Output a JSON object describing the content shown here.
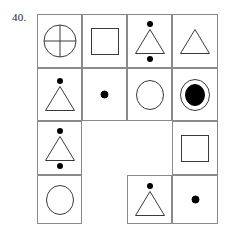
{
  "question": {
    "number": "40."
  },
  "colors": {
    "grid_line": "#8a8a8a",
    "shape_stroke": "#3a3a3a",
    "fill": "#000000",
    "background": "#ffffff"
  },
  "matrix": {
    "rows": 4,
    "columns": 4,
    "cells": [
      {
        "row": 0,
        "col": 0,
        "present": true,
        "figure": "circle-with-cross",
        "dot_above": false,
        "dot_below": false
      },
      {
        "row": 0,
        "col": 1,
        "present": true,
        "figure": "square",
        "dot_above": false,
        "dot_below": false
      },
      {
        "row": 0,
        "col": 2,
        "present": true,
        "figure": "triangle",
        "dot_above": true,
        "dot_below": true
      },
      {
        "row": 0,
        "col": 3,
        "present": true,
        "figure": "triangle",
        "dot_above": false,
        "dot_below": false
      },
      {
        "row": 1,
        "col": 0,
        "present": true,
        "figure": "triangle",
        "dot_above": true,
        "dot_below": false
      },
      {
        "row": 1,
        "col": 1,
        "present": true,
        "figure": "dot",
        "dot_above": false,
        "dot_below": false
      },
      {
        "row": 1,
        "col": 2,
        "present": true,
        "figure": "circle",
        "dot_above": false,
        "dot_below": false
      },
      {
        "row": 1,
        "col": 3,
        "present": true,
        "figure": "circle-with-filled-center",
        "dot_above": false,
        "dot_below": false
      },
      {
        "row": 2,
        "col": 0,
        "present": true,
        "figure": "triangle",
        "dot_above": true,
        "dot_below": true
      },
      {
        "row": 2,
        "col": 1,
        "present": false,
        "figure": "empty",
        "dot_above": false,
        "dot_below": false
      },
      {
        "row": 2,
        "col": 2,
        "present": false,
        "figure": "empty",
        "dot_above": false,
        "dot_below": false
      },
      {
        "row": 2,
        "col": 3,
        "present": true,
        "figure": "square",
        "dot_above": false,
        "dot_below": false
      },
      {
        "row": 3,
        "col": 0,
        "present": true,
        "figure": "circle",
        "dot_above": false,
        "dot_below": false
      },
      {
        "row": 3,
        "col": 1,
        "present": false,
        "figure": "empty",
        "dot_above": false,
        "dot_below": false
      },
      {
        "row": 3,
        "col": 2,
        "present": true,
        "figure": "triangle",
        "dot_above": true,
        "dot_below": false
      },
      {
        "row": 3,
        "col": 3,
        "present": true,
        "figure": "dot",
        "dot_above": false,
        "dot_below": false
      }
    ]
  }
}
